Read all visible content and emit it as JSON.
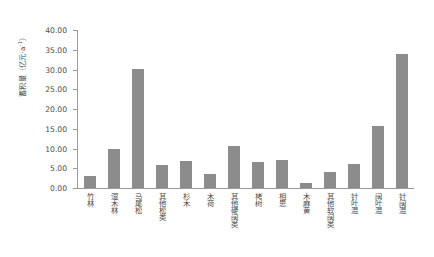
{
  "chart_data": {
    "type": "bar",
    "title": "",
    "xlabel": "",
    "ylabel": "蓄积量（亿元·a-1）",
    "ylabel_main": "蓄积量",
    "ylabel_unit": "（亿元·a",
    "ylabel_exp": "-1",
    "ylabel_unit_close": "）",
    "ylim": [
      0,
      40
    ],
    "ytick_labels": [
      "40.00",
      "35.00",
      "30.00",
      "25.00",
      "20.00",
      "15.00",
      "10.00",
      "5.00",
      "0.00"
    ],
    "ytick_values": [
      40,
      35,
      30,
      25,
      20,
      15,
      10,
      5,
      0
    ],
    "grid": false,
    "legend": null,
    "bar_color": "#8c8c8c",
    "axis_color": "#9a9a9a",
    "text_color": "#4a4a4a",
    "categories": [
      "竹林",
      "湿木林",
      "马尾松",
      "其他松类",
      "杉木",
      "木荷",
      "其他硬阔类",
      "栲树",
      "相思",
      "木麻黄",
      "其他软阔类",
      "针叶混",
      "阔叶混",
      "针阔混"
    ],
    "values": [
      3.0,
      10.0,
      30.2,
      5.8,
      6.9,
      3.5,
      10.6,
      6.7,
      7.2,
      1.2,
      4.1,
      6.0,
      15.8,
      34.0
    ]
  }
}
